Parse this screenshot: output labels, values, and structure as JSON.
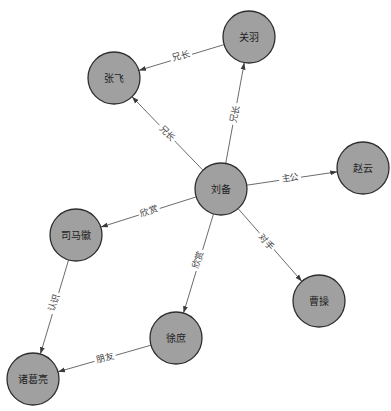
{
  "diagram": {
    "type": "directed-graph",
    "colors": {
      "background": "#ffffff",
      "node_fill": "#a0a0a0",
      "node_stroke": "#2e2e2e",
      "edge": "#5a5a5a",
      "label_text": "#444444"
    },
    "nodes": [
      {
        "id": "liubei",
        "label": "刘备"
      },
      {
        "id": "guanyu",
        "label": "关羽"
      },
      {
        "id": "zhangfei",
        "label": "张飞"
      },
      {
        "id": "zhaoyun",
        "label": "赵云"
      },
      {
        "id": "simahui",
        "label": "司马徽"
      },
      {
        "id": "xushu",
        "label": "徐庶"
      },
      {
        "id": "zhugeliang",
        "label": "诸葛亮"
      },
      {
        "id": "caocao",
        "label": "曹操"
      }
    ],
    "edges": [
      {
        "source": "关羽",
        "target": "张飞",
        "label": "兄长"
      },
      {
        "source": "刘备",
        "target": "张飞",
        "label": "兄长"
      },
      {
        "source": "刘备",
        "target": "关羽",
        "label": "兄长"
      },
      {
        "source": "刘备",
        "target": "赵云",
        "label": "主公"
      },
      {
        "source": "刘备",
        "target": "司马徽",
        "label": "欣赏"
      },
      {
        "source": "刘备",
        "target": "徐庶",
        "label": "欣赏"
      },
      {
        "source": "刘备",
        "target": "曹操",
        "label": "对手"
      },
      {
        "source": "司马徽",
        "target": "诸葛亮",
        "label": "认识"
      },
      {
        "source": "徐庶",
        "target": "诸葛亮",
        "label": "朋友"
      }
    ]
  }
}
